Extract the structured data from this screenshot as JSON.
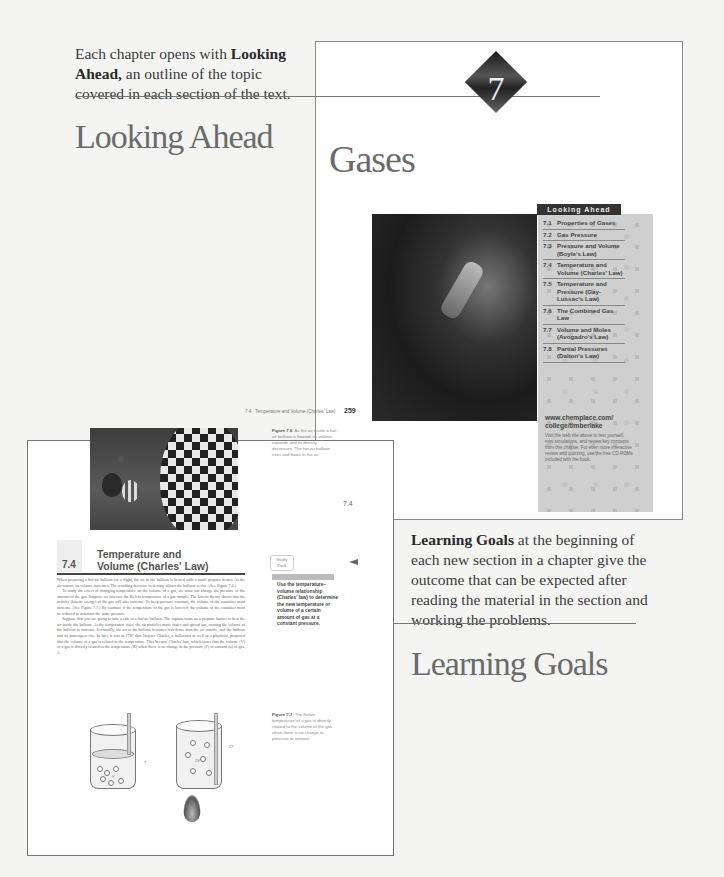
{
  "callouts": {
    "looking_ahead": {
      "bold": "Looking Ahead,",
      "prefix": "Each chapter opens with ",
      "text": " an outline of the topic covered in each section of the text.",
      "heading": "Looking Ahead"
    },
    "learning_goals": {
      "bold": "Learning Goals",
      "text": " at the beginning of each new section in a chapter give the outcome that can be expected after reading the material in the section and working the problems.",
      "heading": "Learning Goals"
    }
  },
  "chapter_page": {
    "chapter_number": "7",
    "chapter_title": "Gases",
    "looking_ahead_header": "Looking Ahead",
    "sections": [
      {
        "num": "7.1",
        "title": "Properties of Gases"
      },
      {
        "num": "7.2",
        "title": "Gas Pressure"
      },
      {
        "num": "7.3",
        "title": "Pressure and Volume (Boyle's Law)"
      },
      {
        "num": "7.4",
        "title": "Temperature and Volume (Charles' Law)"
      },
      {
        "num": "7.5",
        "title": "Temperature and Pressure (Gay-Lussac's Law)"
      },
      {
        "num": "7.6",
        "title": "The Combined Gas Law"
      },
      {
        "num": "7.7",
        "title": "Volume and Moles (Avogadro's Law)"
      },
      {
        "num": "7.8",
        "title": "Partial Pressures (Dalton's Law)"
      }
    ],
    "url": "www.chemplace.com/ college/timberlake",
    "url_desc": "Visit the web site above to test yourself, mini simulations, and review key concepts from this chapter. For even more interactive review and quizzing, use the free CD-ROMs included with the book."
  },
  "section_page": {
    "running_head": "7.4 · Temperature and Volume (Charles' Law)",
    "page_number": "259",
    "figure_7_6": {
      "label": "Figure 7.6",
      "caption": "As the air inside a hot-air balloon is heated, its volume expands and its density decreases. The hot-air balloon rises and floats in the air."
    },
    "section_tab": "7.4",
    "section_number": "7.4",
    "section_title": "Temperature and Volume (Charles' Law)",
    "study_pack": "Study Pack",
    "learning_goal": "Use the temperature–volume relationship (Charles' law) to determine the new temperature or volume of a certain amount of gas at a constant pressure.",
    "body_paragraphs": [
      "When preparing a hot-air balloon for a flight, the air in the balloon is heated with a small propane heater. As the air warms, its volume increases. The resulting decrease in density allows the balloon to rise. (See Figure 7.6.)",
      "To study the effect of changing temperature on the volume of a gas, we must not change the pressure or the amount of the gas. Suppose we increase the Kelvin temperature of a gas sample. The kinetic theory shows that the activity (kinetic energy) of the gas will also increase. To keep pressure constant, the volume of the container must increase. (See Figure 7.7.) By contrast, if the temperature of the gas is lowered, the volume of the container must be reduced to maintain the same pressure.",
      "Suppose that you are going to take a ride in a hot-air balloon. The captain turns on a propane burner to heat the air inside the balloon. As the temperature rises, the air particles move faster and spread out, causing the volume of the balloon to increase. Eventually, the air in the balloon becomes less dense than the air outside, and the balloon and its passengers rise. In fact, it was in 1787 that Jacques Charles, a balloonist as well as a physicist, proposed that the volume of a gas is related to the temperature. This became Charles' law, which states that the volume (V) of a gas is directly related to the temperature (K) when there is no change in the pressure (P) or amount (n) of gas. A"
    ],
    "figure_7_7": {
      "label": "Figure 7.7",
      "caption": "The Kelvin temperature of a gas is directly related to the volume of the gas when there is no change in pressure or amount.",
      "labels": {
        "t1": "T",
        "v1": "V",
        "t2": "2T",
        "v2": "2V"
      }
    }
  }
}
